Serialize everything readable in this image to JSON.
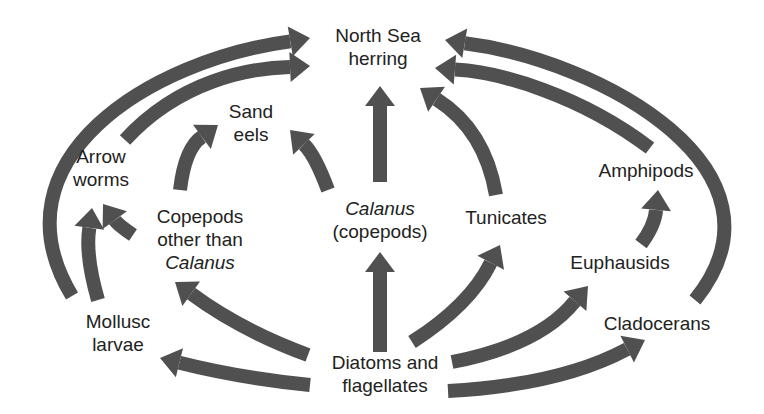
{
  "arrow_color": "#505050",
  "nodes": {
    "herring": {
      "lines": [
        "North Sea",
        "herring"
      ],
      "italic": [
        false,
        false
      ]
    },
    "sand_eels": {
      "lines": [
        "Sand",
        "eels"
      ],
      "italic": [
        false,
        false
      ]
    },
    "arrow_worms": {
      "lines": [
        "Arrow",
        "worms"
      ],
      "italic": [
        false,
        false
      ]
    },
    "copepods_other": {
      "lines": [
        "Copepods",
        "other than",
        "Calanus"
      ],
      "italic": [
        false,
        false,
        true
      ]
    },
    "calanus": {
      "lines": [
        "Calanus",
        "(copepods)"
      ],
      "italic": [
        true,
        false
      ]
    },
    "tunicates": {
      "lines": [
        "Tunicates"
      ],
      "italic": [
        false
      ]
    },
    "amphipods": {
      "lines": [
        "Amphipods"
      ],
      "italic": [
        false
      ]
    },
    "euphausids": {
      "lines": [
        "Euphausids"
      ],
      "italic": [
        false
      ]
    },
    "mollusc_larvae": {
      "lines": [
        "Mollusc",
        "larvae"
      ],
      "italic": [
        false,
        false
      ]
    },
    "cladocerans": {
      "lines": [
        "Cladocerans"
      ],
      "italic": [
        false
      ]
    },
    "diatoms": {
      "lines": [
        "Diatoms and",
        "flagellates"
      ],
      "italic": [
        false,
        false
      ]
    }
  },
  "edges": [
    {
      "from": "diatoms",
      "to": "calanus"
    },
    {
      "from": "diatoms",
      "to": "copepods_other"
    },
    {
      "from": "diatoms",
      "to": "mollusc_larvae"
    },
    {
      "from": "diatoms",
      "to": "tunicates"
    },
    {
      "from": "diatoms",
      "to": "euphausids"
    },
    {
      "from": "diatoms",
      "to": "cladocerans"
    },
    {
      "from": "calanus",
      "to": "herring"
    },
    {
      "from": "calanus",
      "to": "sand_eels"
    },
    {
      "from": "copepods_other",
      "to": "sand_eels"
    },
    {
      "from": "copepods_other",
      "to": "arrow_worms"
    },
    {
      "from": "mollusc_larvae",
      "to": "arrow_worms"
    },
    {
      "from": "mollusc_larvae",
      "to": "herring"
    },
    {
      "from": "arrow_worms",
      "to": "herring"
    },
    {
      "from": "tunicates",
      "to": "herring"
    },
    {
      "from": "euphausids",
      "to": "amphipods"
    },
    {
      "from": "amphipods",
      "to": "herring"
    },
    {
      "from": "cladocerans",
      "to": "herring"
    }
  ]
}
